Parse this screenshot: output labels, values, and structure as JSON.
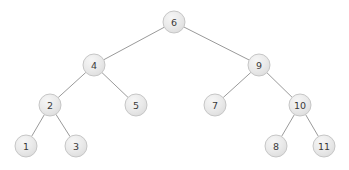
{
  "diagram": {
    "type": "binary-tree",
    "background_color": "#ffffff",
    "node_fill_color": "#e6e6e6",
    "node_highlight_color": "#f4f4f4",
    "node_border_color": "#c6c6c6",
    "edge_color": "#9a9a9a",
    "label_color": "#3a3a3a",
    "node_radius": 11,
    "width": 349,
    "height": 170,
    "nodes": [
      {
        "id": "n6",
        "label": "6",
        "x": 174,
        "y": 22
      },
      {
        "id": "n4",
        "label": "4",
        "x": 94,
        "y": 65
      },
      {
        "id": "n9",
        "label": "9",
        "x": 259,
        "y": 65
      },
      {
        "id": "n2",
        "label": "2",
        "x": 50,
        "y": 105
      },
      {
        "id": "n5",
        "label": "5",
        "x": 136,
        "y": 105
      },
      {
        "id": "n7",
        "label": "7",
        "x": 215,
        "y": 105
      },
      {
        "id": "n10",
        "label": "10",
        "x": 300,
        "y": 105
      },
      {
        "id": "n1",
        "label": "1",
        "x": 26,
        "y": 146
      },
      {
        "id": "n3",
        "label": "3",
        "x": 76,
        "y": 146
      },
      {
        "id": "n8",
        "label": "8",
        "x": 276,
        "y": 146
      },
      {
        "id": "n11",
        "label": "11",
        "x": 324,
        "y": 146
      }
    ],
    "edges": [
      {
        "id": "e6-4",
        "from": "n6",
        "to": "n4",
        "x1": 174,
        "y1": 22,
        "x2": 94,
        "y2": 65
      },
      {
        "id": "e6-9",
        "from": "n6",
        "to": "n9",
        "x1": 174,
        "y1": 22,
        "x2": 259,
        "y2": 65
      },
      {
        "id": "e4-2",
        "from": "n4",
        "to": "n2",
        "x1": 94,
        "y1": 65,
        "x2": 50,
        "y2": 105
      },
      {
        "id": "e4-5",
        "from": "n4",
        "to": "n5",
        "x1": 94,
        "y1": 65,
        "x2": 136,
        "y2": 105
      },
      {
        "id": "e9-7",
        "from": "n9",
        "to": "n7",
        "x1": 259,
        "y1": 65,
        "x2": 215,
        "y2": 105
      },
      {
        "id": "e9-10",
        "from": "n9",
        "to": "n10",
        "x1": 259,
        "y1": 65,
        "x2": 300,
        "y2": 105
      },
      {
        "id": "e2-1",
        "from": "n2",
        "to": "n1",
        "x1": 50,
        "y1": 105,
        "x2": 26,
        "y2": 146
      },
      {
        "id": "e2-3",
        "from": "n2",
        "to": "n3",
        "x1": 50,
        "y1": 105,
        "x2": 76,
        "y2": 146
      },
      {
        "id": "e10-8",
        "from": "n10",
        "to": "n8",
        "x1": 300,
        "y1": 105,
        "x2": 276,
        "y2": 146
      },
      {
        "id": "e10-11",
        "from": "n10",
        "to": "n11",
        "x1": 300,
        "y1": 105,
        "x2": 324,
        "y2": 146
      }
    ]
  }
}
